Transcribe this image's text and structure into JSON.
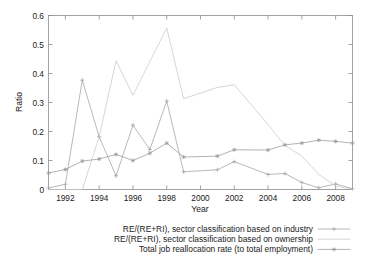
{
  "chart_data": {
    "type": "line",
    "title": "",
    "xlabel": "Year",
    "ylabel": "Ratio",
    "xlim": [
      1991,
      2009
    ],
    "ylim": [
      0,
      0.6
    ],
    "grid": false,
    "legend_position": "below-plot",
    "x_ticks": [
      "1992",
      "1994",
      "1996",
      "1998",
      "2000",
      "2002",
      "2004",
      "2006",
      "2008"
    ],
    "x_tick_values": [
      1992,
      1994,
      1996,
      1998,
      2000,
      2002,
      2004,
      2006,
      2008
    ],
    "y_ticks": [
      "0",
      "0.1",
      "0.2",
      "0.3",
      "0.4",
      "0.5",
      "0.6"
    ],
    "y_tick_values": [
      0,
      0.1,
      0.2,
      0.3,
      0.4,
      0.5,
      0.6
    ],
    "x": [
      1991,
      1992,
      1993,
      1994,
      1995,
      1996,
      1997,
      1998,
      1999,
      2001,
      2002,
      2004,
      2005,
      2006,
      2007,
      2008,
      2009
    ],
    "series": [
      {
        "name": "RE/(RE+RI), sector classification based on industry",
        "marker": "plus",
        "color": "#a0a0a0",
        "values": [
          0.005,
          0.018,
          0.377,
          0.182,
          0.047,
          0.222,
          0.138,
          0.305,
          0.061,
          0.068,
          0.096,
          0.052,
          0.055,
          0.024,
          0.006,
          0.019,
          0.003
        ]
      },
      {
        "name": "RE/(RE+RI), sector classification based on ownership",
        "marker": "dot",
        "color": "#c8c8c8",
        "values": [
          0.0,
          0.0,
          0.0,
          0.182,
          0.444,
          0.325,
          0.441,
          0.557,
          0.313,
          0.352,
          0.361,
          0.224,
          0.152,
          0.115,
          0.052,
          0.012,
          0.0
        ]
      },
      {
        "name": "Total job reallocation rate (to total employment)",
        "marker": "star",
        "color": "#9a9a9a",
        "values": [
          0.057,
          0.069,
          0.098,
          0.105,
          0.121,
          0.1,
          0.125,
          0.16,
          0.112,
          0.115,
          0.137,
          0.136,
          0.154,
          0.16,
          0.17,
          0.166,
          0.16
        ]
      }
    ]
  },
  "legend": {
    "entries": [
      "RE/(RE+RI), sector classification based on industry",
      "RE/(RE+RI), sector classification based on ownership",
      "Total job reallocation rate (to total employment)"
    ]
  },
  "axes": {
    "x_title": "Year",
    "y_title": "Ratio"
  },
  "colors": {
    "frame": "#8c8c8c",
    "text": "#1a1a1a",
    "background": "#ffffff",
    "series_industry": "#a0a0a0",
    "series_ownership": "#c8c8c8",
    "series_reallocation": "#9a9a9a"
  }
}
